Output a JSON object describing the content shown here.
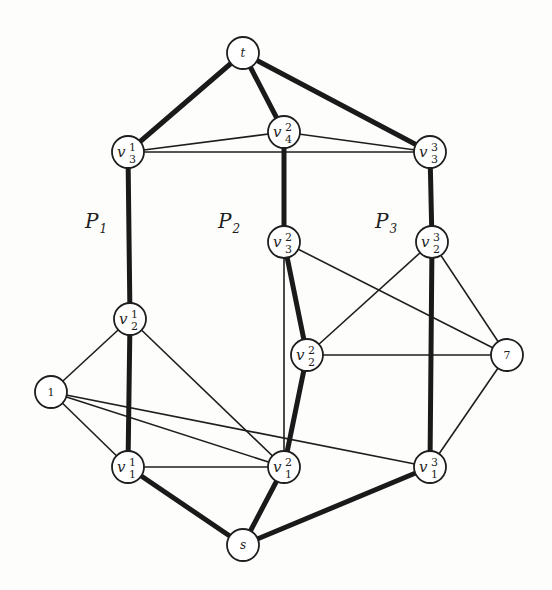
{
  "graph": {
    "nodes": [
      {
        "id": "t",
        "label": "t",
        "type": "italic",
        "x": 243,
        "y": 53
      },
      {
        "id": "v13",
        "label": "v",
        "sup": "1",
        "sub": "3",
        "x": 128,
        "y": 152
      },
      {
        "id": "v24",
        "label": "v",
        "sup": "2",
        "sub": "4",
        "x": 284,
        "y": 132
      },
      {
        "id": "v33",
        "label": "v",
        "sup": "3",
        "sub": "3",
        "x": 430,
        "y": 152
      },
      {
        "id": "v23",
        "label": "v",
        "sup": "2",
        "sub": "3",
        "x": 284,
        "y": 242
      },
      {
        "id": "v32",
        "label": "v",
        "sup": "3",
        "sub": "2",
        "x": 432,
        "y": 242
      },
      {
        "id": "v12",
        "label": "v",
        "sup": "1",
        "sub": "2",
        "x": 130,
        "y": 319
      },
      {
        "id": "v22",
        "label": "v",
        "sup": "2",
        "sub": "2",
        "x": 307,
        "y": 355
      },
      {
        "id": "n7",
        "label": "7",
        "type": "plain",
        "x": 507,
        "y": 355
      },
      {
        "id": "n1",
        "label": "1",
        "type": "plain",
        "x": 51,
        "y": 392
      },
      {
        "id": "v11",
        "label": "v",
        "sup": "1",
        "sub": "1",
        "x": 128,
        "y": 467
      },
      {
        "id": "v21",
        "label": "v",
        "sup": "2",
        "sub": "1",
        "x": 284,
        "y": 467
      },
      {
        "id": "v31",
        "label": "v",
        "sup": "3",
        "sub": "1",
        "x": 430,
        "y": 467
      },
      {
        "id": "s",
        "label": "s",
        "type": "italic",
        "x": 243,
        "y": 545
      }
    ],
    "thick_edges": [
      [
        "t",
        "v13"
      ],
      [
        "t",
        "v24"
      ],
      [
        "t",
        "v33"
      ],
      [
        "v13",
        "v12"
      ],
      [
        "v12",
        "v11"
      ],
      [
        "v11",
        "s"
      ],
      [
        "v24",
        "v23"
      ],
      [
        "v23",
        "v22"
      ],
      [
        "v22",
        "v21"
      ],
      [
        "v21",
        "s"
      ],
      [
        "v33",
        "v32"
      ],
      [
        "v32",
        "v31"
      ],
      [
        "v31",
        "s"
      ]
    ],
    "thin_edges": [
      [
        "v13",
        "v24"
      ],
      [
        "v13",
        "v33"
      ],
      [
        "v24",
        "v33"
      ],
      [
        "v23",
        "v21"
      ],
      [
        "v23",
        "n7"
      ],
      [
        "v32",
        "v22"
      ],
      [
        "v32",
        "n7"
      ],
      [
        "v22",
        "n7"
      ],
      [
        "n7",
        "v31"
      ],
      [
        "v12",
        "n1"
      ],
      [
        "v12",
        "v21"
      ],
      [
        "n1",
        "v11"
      ],
      [
        "n1",
        "v21"
      ],
      [
        "n1",
        "v31"
      ],
      [
        "v11",
        "v21"
      ]
    ],
    "path_labels": [
      {
        "main": "P",
        "sub": "1",
        "x": 85,
        "y": 228
      },
      {
        "main": "P",
        "sub": "2",
        "x": 218,
        "y": 228
      },
      {
        "main": "P",
        "sub": "3",
        "x": 375,
        "y": 228
      }
    ],
    "node_radius": 16
  }
}
